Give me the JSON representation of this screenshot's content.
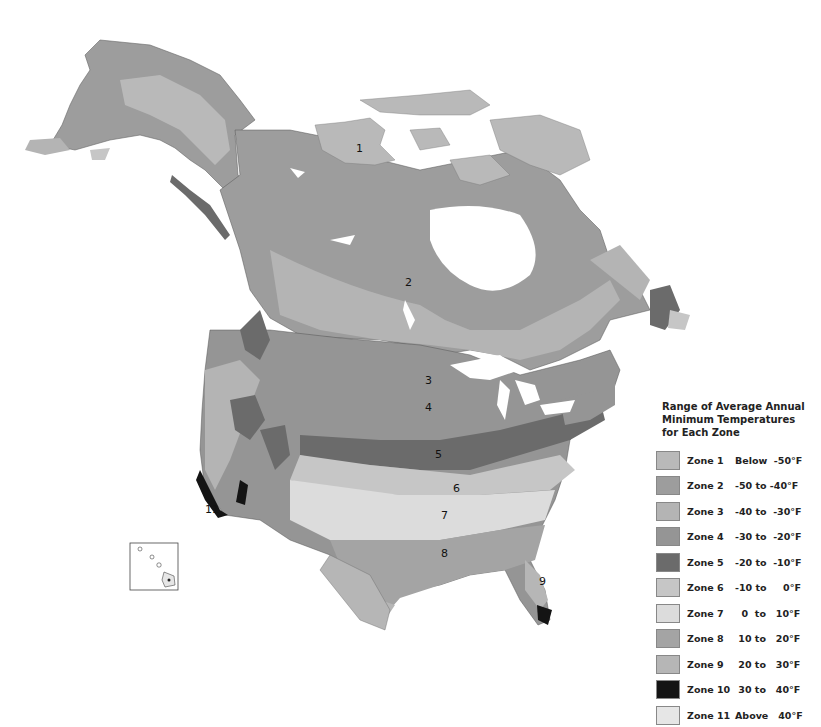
{
  "legend": {
    "title_line1": "Range of Average Annual",
    "title_line2": "Minimum Temperatures",
    "title_line3": "for Each Zone",
    "zones": [
      {
        "name": "Zone 1",
        "range": "Below  -50°F",
        "color": "#b9b9b9"
      },
      {
        "name": "Zone 2",
        "range": "-50 to -40°F",
        "color": "#9d9d9d"
      },
      {
        "name": "Zone 3",
        "range": "-40 to  -30°F",
        "color": "#b4b4b4"
      },
      {
        "name": "Zone 4",
        "range": "-30 to  -20°F",
        "color": "#959595"
      },
      {
        "name": "Zone 5",
        "range": "-20 to  -10°F",
        "color": "#6b6b6b"
      },
      {
        "name": "Zone 6",
        "range": "-10 to     0°F",
        "color": "#c6c6c6"
      },
      {
        "name": "Zone 7",
        "range": "  0  to   10°F",
        "color": "#dcdcdc"
      },
      {
        "name": "Zone 8",
        "range": " 10 to   20°F",
        "color": "#a4a4a4"
      },
      {
        "name": "Zone 9",
        "range": " 20 to   30°F",
        "color": "#b6b6b6"
      },
      {
        "name": "Zone 10",
        "range": " 30 to   40°F",
        "color": "#141414"
      },
      {
        "name": "Zone 11",
        "range": "Above   40°F",
        "color": "#e6e6e6"
      }
    ]
  },
  "map": {
    "labels": [
      {
        "text": "1",
        "x": 356,
        "y": 152
      },
      {
        "text": "2",
        "x": 407,
        "y": 286
      },
      {
        "text": "3",
        "x": 426,
        "y": 384
      },
      {
        "text": "4",
        "x": 428,
        "y": 411
      },
      {
        "text": "5",
        "x": 437,
        "y": 458
      },
      {
        "text": "6",
        "x": 455,
        "y": 492
      },
      {
        "text": "7",
        "x": 443,
        "y": 519
      },
      {
        "text": "8",
        "x": 443,
        "y": 557
      },
      {
        "text": "9",
        "x": 541,
        "y": 585
      },
      {
        "text": "11",
        "x": 207,
        "y": 513
      }
    ]
  }
}
